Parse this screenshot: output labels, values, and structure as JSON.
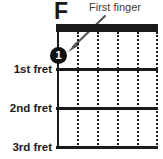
{
  "diagram": {
    "type": "guitar-chord-diagram",
    "chord_name": "F",
    "annotation": {
      "label": "First finger",
      "arrow": "points from label down-left to the finger dot on the 1st string at the 1st fret"
    },
    "fretboard": {
      "string_count": 6,
      "fret_count": 3,
      "nut_shown": true
    },
    "fret_labels": [
      {
        "text": "1st fret"
      },
      {
        "text": "2nd fret"
      },
      {
        "text": "3rd fret"
      }
    ],
    "finger_markers": [
      {
        "finger": "1",
        "string_index": 0,
        "fret": 1
      }
    ],
    "colors": {
      "ink": "#1a1a1a",
      "annotation_text": "#3d3d3d",
      "background": "#ffffff",
      "dot_fill": "#111111",
      "dot_text": "#ffffff"
    }
  }
}
